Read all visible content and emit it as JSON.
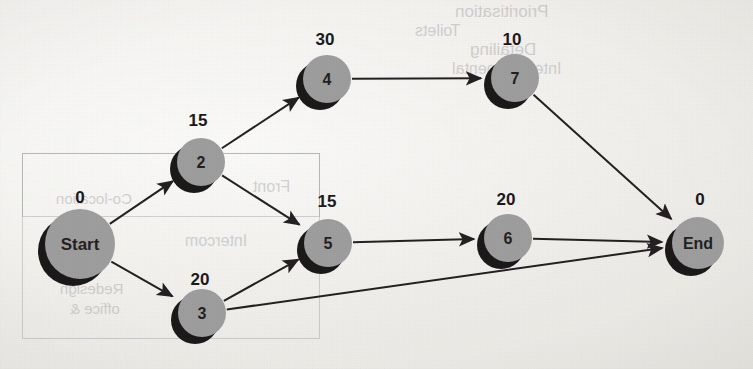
{
  "diagram": {
    "type": "activity-network-diagram",
    "node_fill_color": "#9d9d9d",
    "node_shadow_color": "#1b1718",
    "edge_color": "#231f20",
    "background_color": "#eceae5",
    "nodes": [
      {
        "id": "start",
        "label": "Start",
        "duration": "0",
        "cx": 80,
        "cy": 244,
        "r": 35,
        "label_font_size": 17,
        "duration_x": 80,
        "duration_y": 203
      },
      {
        "id": "n2",
        "label": "2",
        "duration": "15",
        "cx": 201,
        "cy": 162,
        "r": 24,
        "label_font_size": 16,
        "duration_x": 198,
        "duration_y": 126
      },
      {
        "id": "n3",
        "label": "3",
        "duration": "20",
        "cx": 202,
        "cy": 313,
        "r": 24,
        "label_font_size": 16,
        "duration_x": 200,
        "duration_y": 285
      },
      {
        "id": "n4",
        "label": "4",
        "duration": "30",
        "cx": 327,
        "cy": 79,
        "r": 24,
        "label_font_size": 16,
        "duration_x": 325,
        "duration_y": 45
      },
      {
        "id": "n5",
        "label": "5",
        "duration": "15",
        "cx": 328,
        "cy": 243,
        "r": 24,
        "label_font_size": 16,
        "duration_x": 327,
        "duration_y": 207
      },
      {
        "id": "n6",
        "label": "6",
        "duration": "20",
        "cx": 508,
        "cy": 238,
        "r": 24,
        "label_font_size": 16,
        "duration_x": 506,
        "duration_y": 205
      },
      {
        "id": "n7",
        "label": "7",
        "duration": "10",
        "cx": 515,
        "cy": 78,
        "r": 24,
        "label_font_size": 16,
        "duration_x": 512,
        "duration_y": 45
      },
      {
        "id": "end",
        "label": "End",
        "duration": "0",
        "cx": 698,
        "cy": 243,
        "r": 26,
        "label_font_size": 16,
        "duration_x": 700,
        "duration_y": 205
      }
    ],
    "edges": [
      {
        "id": "e-start-2",
        "from": "start",
        "to": "n2"
      },
      {
        "id": "e-start-3",
        "from": "start",
        "to": "n3"
      },
      {
        "id": "e-2-4",
        "from": "n2",
        "to": "n4"
      },
      {
        "id": "e-2-5",
        "from": "n2",
        "to": "n5"
      },
      {
        "id": "e-3-5",
        "from": "n3",
        "to": "n5"
      },
      {
        "id": "e-3-end",
        "from": "n3",
        "to": "end"
      },
      {
        "id": "e-4-7",
        "from": "n4",
        "to": "n7"
      },
      {
        "id": "e-5-6",
        "from": "n5",
        "to": "n6"
      },
      {
        "id": "e-6-end",
        "from": "n6",
        "to": "end"
      },
      {
        "id": "e-7-end",
        "from": "n7",
        "to": "end"
      }
    ],
    "bleed_through": {
      "note": "faint mirrored text showing through from the reverse side of the scanned page",
      "items": [
        {
          "id": "bt-1",
          "text": "Prioritisation",
          "x": 455,
          "y": 2,
          "size": 17
        },
        {
          "id": "bt-2",
          "text": "Toilets",
          "x": 415,
          "y": 22,
          "size": 16
        },
        {
          "id": "bt-3",
          "text": "Detailing",
          "x": 470,
          "y": 40,
          "size": 17
        },
        {
          "id": "bt-4",
          "text": "Intercontinental",
          "x": 452,
          "y": 60,
          "size": 16
        },
        {
          "id": "bt-5",
          "text": "Front",
          "x": 253,
          "y": 178,
          "size": 16
        },
        {
          "id": "bt-6",
          "text": "Co-location",
          "x": 56,
          "y": 190,
          "size": 15
        },
        {
          "id": "bt-7",
          "text": "Intercom",
          "x": 185,
          "y": 232,
          "size": 16
        },
        {
          "id": "bt-8",
          "text": "Redesign",
          "x": 60,
          "y": 280,
          "size": 15
        },
        {
          "id": "bt-9",
          "text": "office &",
          "x": 70,
          "y": 300,
          "size": 15
        }
      ],
      "boxes": [
        {
          "id": "bx-1",
          "x": 22,
          "y": 153,
          "w": 296,
          "h": 184
        },
        {
          "id": "bx-2",
          "x": 22,
          "y": 153,
          "w": 296,
          "h": 62
        }
      ]
    }
  }
}
